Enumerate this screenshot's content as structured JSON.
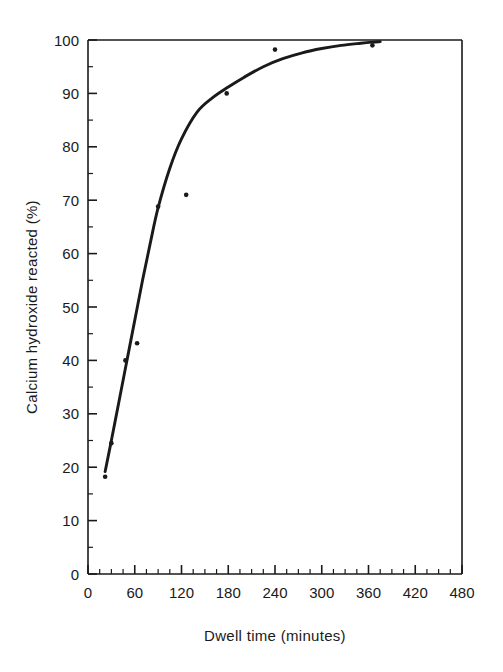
{
  "chart_data": {
    "type": "scatter",
    "title": "",
    "xlabel": "Dwell time  (minutes)",
    "ylabel": "Calcium hydroxide reacted (%)",
    "xlim": [
      0,
      480
    ],
    "ylim": [
      0,
      100
    ],
    "xticks": [
      0,
      60,
      120,
      180,
      240,
      300,
      360,
      420,
      480
    ],
    "yticks": [
      0,
      10,
      20,
      30,
      40,
      50,
      60,
      70,
      80,
      90,
      100
    ],
    "xtick_labels": [
      "0",
      "60",
      "120",
      "180",
      "240",
      "300",
      "360",
      "420",
      "480"
    ],
    "ytick_labels": [
      "0",
      "10",
      "20",
      "30",
      "40",
      "50",
      "60",
      "70",
      "80",
      "90",
      "100"
    ],
    "x_minor_tick_interval": 15,
    "y_minor_tick_interval": 5,
    "grid": false,
    "legend": null,
    "series": [
      {
        "name": "Measured data points",
        "marker": "dot",
        "points": [
          {
            "x": 22,
            "y": 18.2
          },
          {
            "x": 30,
            "y": 24.5
          },
          {
            "x": 48,
            "y": 40.0
          },
          {
            "x": 63,
            "y": 43.2
          },
          {
            "x": 90,
            "y": 68.8
          },
          {
            "x": 126,
            "y": 71.0
          },
          {
            "x": 178,
            "y": 90.0
          },
          {
            "x": 240,
            "y": 98.2
          },
          {
            "x": 365,
            "y": 99.0
          }
        ]
      },
      {
        "name": "Fitted curve",
        "marker": "line",
        "points": [
          {
            "x": 22,
            "y": 19.2
          },
          {
            "x": 30,
            "y": 25.0
          },
          {
            "x": 40,
            "y": 32.5
          },
          {
            "x": 50,
            "y": 40.0
          },
          {
            "x": 60,
            "y": 47.5
          },
          {
            "x": 70,
            "y": 55.0
          },
          {
            "x": 80,
            "y": 62.0
          },
          {
            "x": 90,
            "y": 68.6
          },
          {
            "x": 105,
            "y": 76.0
          },
          {
            "x": 120,
            "y": 81.5
          },
          {
            "x": 140,
            "y": 86.5
          },
          {
            "x": 160,
            "y": 89.2
          },
          {
            "x": 180,
            "y": 91.2
          },
          {
            "x": 200,
            "y": 93.0
          },
          {
            "x": 225,
            "y": 95.0
          },
          {
            "x": 250,
            "y": 96.5
          },
          {
            "x": 275,
            "y": 97.6
          },
          {
            "x": 300,
            "y": 98.4
          },
          {
            "x": 325,
            "y": 99.0
          },
          {
            "x": 350,
            "y": 99.4
          },
          {
            "x": 365,
            "y": 99.6
          },
          {
            "x": 375,
            "y": 99.7
          }
        ]
      }
    ]
  },
  "axes": {
    "x_axis_title": "Dwell time  (minutes)",
    "y_axis_title": "Calcium hydroxide reacted (%)"
  },
  "colors": {
    "axis": "#1a1a1a",
    "curve": "#1a1a1a",
    "marker": "#1a1a1a",
    "background": "#ffffff"
  }
}
